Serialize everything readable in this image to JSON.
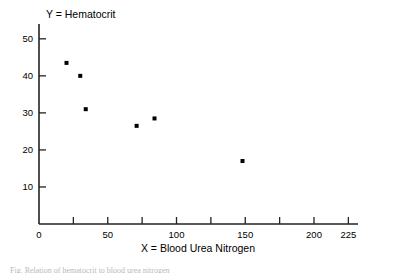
{
  "chart_data": {
    "type": "scatter",
    "title": "",
    "ylabel": "Y = Hematocrit",
    "xlabel": "X = Blood Urea Nitrogen",
    "xlim": [
      0,
      232
    ],
    "ylim": [
      0,
      54
    ],
    "grid": false,
    "legend": null,
    "x_ticks": [
      {
        "value": 0,
        "label": "0",
        "major": true
      },
      {
        "value": 25,
        "label": "",
        "major": false
      },
      {
        "value": 50,
        "label": "50",
        "major": true
      },
      {
        "value": 75,
        "label": "",
        "major": false
      },
      {
        "value": 100,
        "label": "100",
        "major": true
      },
      {
        "value": 125,
        "label": "",
        "major": false
      },
      {
        "value": 150,
        "label": "150",
        "major": true
      },
      {
        "value": 175,
        "label": "",
        "major": false
      },
      {
        "value": 200,
        "label": "200",
        "major": true
      },
      {
        "value": 225,
        "label": "225",
        "major": true
      }
    ],
    "y_ticks": [
      {
        "value": 10,
        "label": "10"
      },
      {
        "value": 20,
        "label": "20"
      },
      {
        "value": 30,
        "label": "30"
      },
      {
        "value": 40,
        "label": "40"
      },
      {
        "value": 50,
        "label": "50"
      }
    ],
    "points": [
      {
        "x": 20,
        "y": 43.5
      },
      {
        "x": 30,
        "y": 40.0
      },
      {
        "x": 34,
        "y": 31.0
      },
      {
        "x": 71,
        "y": 26.5
      },
      {
        "x": 84,
        "y": 28.5
      },
      {
        "x": 148,
        "y": 17.0
      }
    ],
    "marker": {
      "shape": "square",
      "size": 4,
      "color": "#000000"
    }
  },
  "figure": {
    "axis_color": "#222222",
    "caption_partial": "Fig. Relation of hematocrit to blood urea nitrogen"
  }
}
